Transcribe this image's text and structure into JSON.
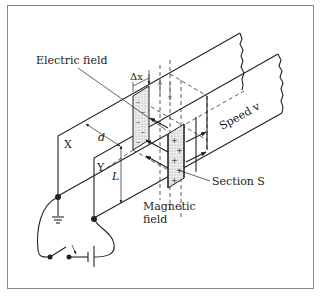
{
  "figure": {
    "labels": {
      "electric_field": "Electric field",
      "delta_x": "Δx",
      "d": "d",
      "x_plate": "X",
      "y_plate": "Y",
      "L": "L",
      "speed": "Speed v",
      "section": "Section S",
      "magnetic_line1": "Magnetic",
      "magnetic_line2": "field"
    },
    "charges": {
      "negative": "–",
      "positive": "+"
    },
    "colors": {
      "line": "#222222",
      "frame": "#8a8a8a",
      "shading": "#d9d9d9",
      "background": "#ffffff"
    }
  }
}
